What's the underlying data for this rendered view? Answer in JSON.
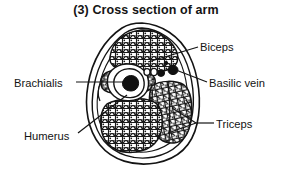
{
  "figure": {
    "title": "(3) Cross section of arm",
    "title_number": "(3)",
    "subject": "Cross section of arm",
    "style": "black-and-white anatomical line drawing, stippled muscle texture",
    "background_color": "#ffffff",
    "ink_color": "#141414"
  },
  "labels": {
    "biceps": "Biceps",
    "basilic_vein": "Basilic vein",
    "brachialis": "Brachialis",
    "humerus": "Humerus",
    "triceps": "Triceps"
  },
  "structures": [
    {
      "name": "Biceps",
      "description": "large stippled muscle compartment, upper portion of section"
    },
    {
      "name": "Basilic vein",
      "description": "small dark round vessel lying lateral-right of center"
    },
    {
      "name": "Brachialis",
      "description": "stippled muscle compartment, left of the humerus"
    },
    {
      "name": "Humerus",
      "description": "central bone ring with dark medullary cavity"
    },
    {
      "name": "Triceps",
      "description": "stippled muscle compartment, lower and right of section, two headed"
    }
  ],
  "leaders": {
    "biceps": "line from label left edge running down-left into the biceps mass",
    "basilic_vein": "line from label left edge running up-left to the vein cluster",
    "brachialis": "line from label right edge running right into the brachialis mass",
    "humerus": "line from label right edge running up-right to the bone ring",
    "triceps": "forked two-pronged leader from label left edge into both triceps heads"
  }
}
